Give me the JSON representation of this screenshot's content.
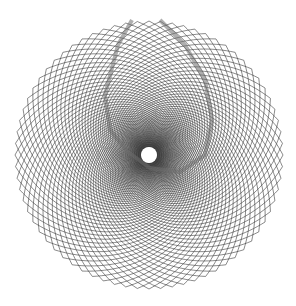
{
  "figure": {
    "width": 296,
    "height": 306,
    "background": "#ffffff",
    "center": [
      149,
      155
    ],
    "outer_radius": 134,
    "inner_radius": 8,
    "stroke_color": "#3a3a3a",
    "band_color": "#6e6e6e",
    "families": [
      {
        "name": "clockwise-spirals",
        "count": 72,
        "twist": 1.9
      },
      {
        "name": "counterclockwise-spirals",
        "count": 72,
        "twist": -1.9
      }
    ],
    "teardrop_band": {
      "points": [
        [
          132,
          20
        ],
        [
          118,
          45
        ],
        [
          105,
          95
        ],
        [
          110,
          130
        ],
        [
          128,
          152
        ],
        [
          150,
          168
        ],
        [
          180,
          172
        ],
        [
          205,
          155
        ],
        [
          212,
          120
        ],
        [
          205,
          80
        ],
        [
          185,
          45
        ],
        [
          160,
          20
        ]
      ],
      "width": 4
    }
  }
}
